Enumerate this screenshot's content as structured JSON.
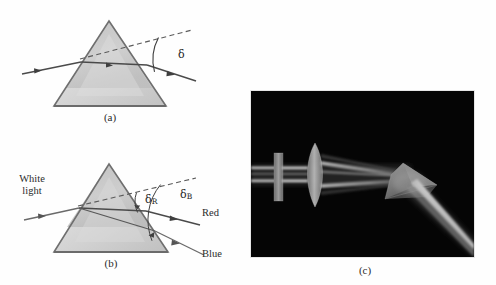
{
  "figure": {
    "width": 496,
    "height": 285,
    "background": "#fefefe",
    "panels": [
      {
        "id": "a",
        "caption": "(a)",
        "description": "Single light ray refracted through a triangular prism, deviated by angle delta",
        "labels": {
          "deviation": "δ"
        }
      },
      {
        "id": "b",
        "caption": "(b)",
        "description": "White light dispersed by a prism into red and blue rays with deviation angles delta-R and delta-B",
        "labels": {
          "incident": "White light",
          "incident_line1": "White",
          "incident_line2": "light",
          "deviation_red": "δ",
          "deviation_red_sub": "R",
          "deviation_blue": "δ",
          "deviation_blue_sub": "B",
          "red_ray": "Red",
          "blue_ray": "Blue"
        }
      },
      {
        "id": "c",
        "caption": "(c)",
        "description": "Photograph of a white light beam passing through a slit and lens then dispersing through a prism on a black background"
      }
    ]
  },
  "colors": {
    "prism_fill_light": "#c9c9c9",
    "prism_fill_lighter": "#d8d8d8",
    "prism_fill_dark": "#b4b4b4",
    "prism_stroke": "#6f6f6f",
    "ray_stroke": "#4a4a4a",
    "dashed_stroke": "#5a5a5a",
    "arc_stroke": "#3f3f3f",
    "text": "#2b2b2b",
    "photo_background": "#050505",
    "photo_border": "#e8e8e8",
    "beam_light": "#cfcfcf"
  },
  "photo": {
    "elements": [
      {
        "name": "slit-plate",
        "label": "slit aperture plate"
      },
      {
        "name": "converging-lens",
        "label": "converging lens"
      },
      {
        "name": "prism",
        "label": "glass prism"
      },
      {
        "name": "incident-beam",
        "label": "collimated white beam"
      },
      {
        "name": "dispersed-beam",
        "label": "dispersed spectrum beam"
      }
    ],
    "frame": {
      "x": 250,
      "y": 90,
      "width": 225,
      "height": 168
    }
  }
}
